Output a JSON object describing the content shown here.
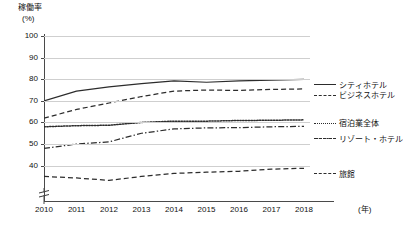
{
  "chart_data": {
    "type": "line",
    "title": "",
    "ylabel": "稼働率",
    "yunit": "(%)",
    "xlabel": "",
    "xunit": "(年)",
    "ylim": [
      30,
      100
    ],
    "ytick_values": [
      100,
      90,
      80,
      70,
      60,
      50,
      40
    ],
    "ytick_labels": [
      "100",
      "90",
      "80",
      "70",
      "60",
      "50",
      "40"
    ],
    "axis_break": true,
    "grid": "horizontal",
    "legend_position": "right",
    "categories": [
      "2010",
      "2011",
      "2012",
      "2013",
      "2014",
      "2015",
      "2016",
      "2017",
      "2018"
    ],
    "x": [
      2010,
      2011,
      2012,
      2013,
      2014,
      2015,
      2016,
      2017,
      2018
    ],
    "series": [
      {
        "name": "シティホテル",
        "style": "solid",
        "color": "#2c2c2c",
        "values": [
          70.0,
          74.5,
          76.5,
          78.0,
          79.2,
          78.6,
          79.2,
          79.6,
          79.9
        ]
      },
      {
        "name": "ビジネスホテル",
        "style": "dashed",
        "color": "#2c2c2c",
        "values": [
          62.0,
          66.0,
          69.0,
          72.0,
          74.5,
          75.0,
          74.8,
          75.3,
          75.5
        ]
      },
      {
        "name": "宿泊業全体",
        "style": "dotted",
        "color": "#2c2c2c",
        "values": [
          58.0,
          58.5,
          58.7,
          60.0,
          60.6,
          60.6,
          60.9,
          61.0,
          61.2
        ]
      },
      {
        "name": "リゾート・ホテル",
        "style": "dashdot",
        "color": "#2c2c2c",
        "values": [
          48.0,
          50.0,
          51.0,
          55.0,
          57.0,
          57.5,
          57.6,
          58.0,
          58.2
        ]
      },
      {
        "name": "旅館",
        "style": "dashed",
        "color": "#2c2c2c",
        "values": [
          35.0,
          34.3,
          33.2,
          35.0,
          36.4,
          37.0,
          37.4,
          38.4,
          38.8
        ]
      }
    ]
  },
  "legend": {
    "items": [
      {
        "label": "シティホテル"
      },
      {
        "label": "ビジネスホテル"
      },
      {
        "label": "宿泊業全体"
      },
      {
        "label": "リゾート・ホテル"
      },
      {
        "label": "旅館"
      }
    ]
  }
}
